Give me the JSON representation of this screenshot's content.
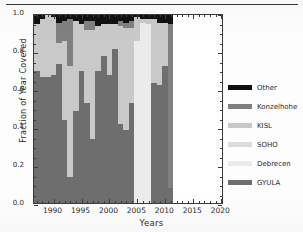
{
  "chart_data": {
    "type": "bar",
    "subtype": "stacked-bar",
    "title": "",
    "xlabel": "Years",
    "ylabel": "Fraction of Year Covered",
    "xlim": [
      1986.5,
      2020.5
    ],
    "ylim": [
      0.0,
      1.0
    ],
    "grid": false,
    "legend_position": "right",
    "xticks": [
      "1990",
      "1995",
      "2000",
      "2005",
      "2010",
      "2015",
      "2020"
    ],
    "xtick_values": [
      1990,
      1995,
      2000,
      2005,
      2010,
      2015,
      2020
    ],
    "yticks": [
      "0.0",
      "0.2",
      "0.4",
      "0.6",
      "0.8",
      "1.0"
    ],
    "ytick_values": [
      0.0,
      0.2,
      0.4,
      0.6,
      0.8,
      1.0
    ],
    "legend": [
      "Other",
      "Konzelhohe",
      "KISL",
      "SOHO",
      "Debrecen",
      "GYULA"
    ],
    "series_order_bottom_to_top": [
      "GYULA",
      "Debrecen",
      "SOHO",
      "KISL",
      "Konzelhohe",
      "Other"
    ],
    "colors": {
      "Other": "#111111",
      "Konzelhohe": "#808080",
      "KISL": "#c9c9c9",
      "SOHO": "#dcdcdc",
      "Debrecen": "#ebebeb",
      "GYULA": "#6e6e6e"
    },
    "categories": [
      1987,
      1988,
      1989,
      1990,
      1991,
      1992,
      1993,
      1994,
      1995,
      1996,
      1997,
      1998,
      1999,
      2000,
      2001,
      2002,
      2003,
      2004,
      2005,
      2006,
      2007,
      2008,
      2009,
      2010,
      2011
    ],
    "series": [
      {
        "name": "GYULA",
        "values": [
          0.7,
          0.67,
          0.67,
          0.68,
          0.74,
          0.44,
          0.14,
          0.49,
          0.7,
          0.53,
          0.34,
          0.7,
          0.78,
          0.68,
          0.82,
          0.42,
          0.39,
          0.53,
          0.0,
          0.0,
          0.0,
          0.64,
          0.63,
          0.73,
          0.08
        ]
      },
      {
        "name": "Debrecen",
        "values": [
          0.0,
          0.0,
          0.0,
          0.0,
          0.0,
          0.0,
          0.0,
          0.0,
          0.0,
          0.0,
          0.0,
          0.0,
          0.0,
          0.0,
          0.0,
          0.0,
          0.0,
          0.0,
          0.86,
          0.96,
          0.95,
          0.0,
          0.0,
          0.0,
          0.0
        ]
      },
      {
        "name": "SOHO",
        "values": [
          0.0,
          0.0,
          0.0,
          0.0,
          0.0,
          0.0,
          0.0,
          0.0,
          0.0,
          0.0,
          0.0,
          0.0,
          0.0,
          0.0,
          0.0,
          0.0,
          0.0,
          0.0,
          0.0,
          0.0,
          0.0,
          0.0,
          0.0,
          0.0,
          0.0
        ]
      },
      {
        "name": "KISL",
        "values": [
          0.25,
          0.31,
          0.33,
          0.31,
          0.11,
          0.42,
          0.59,
          0.48,
          0.25,
          0.39,
          0.58,
          0.24,
          0.17,
          0.27,
          0.13,
          0.52,
          0.54,
          0.4,
          0.13,
          0.02,
          0.03,
          0.34,
          0.33,
          0.23,
          0.0
        ]
      },
      {
        "name": "Konzelhohe",
        "values": [
          0.0,
          0.0,
          0.0,
          0.0,
          0.11,
          0.11,
          0.25,
          0.0,
          0.0,
          0.05,
          0.05,
          0.0,
          0.0,
          0.0,
          0.0,
          0.03,
          0.03,
          0.04,
          0.0,
          0.0,
          0.0,
          0.0,
          0.0,
          0.0,
          0.87
        ]
      },
      {
        "name": "Other",
        "values": [
          0.05,
          0.02,
          0.0,
          0.01,
          0.04,
          0.03,
          0.02,
          0.03,
          0.05,
          0.03,
          0.03,
          0.06,
          0.05,
          0.05,
          0.05,
          0.03,
          0.04,
          0.03,
          0.01,
          0.02,
          0.02,
          0.02,
          0.04,
          0.04,
          0.05
        ]
      }
    ]
  },
  "axes": {
    "ytitle": "Fraction of Year Covered",
    "xtitle": "Years"
  }
}
